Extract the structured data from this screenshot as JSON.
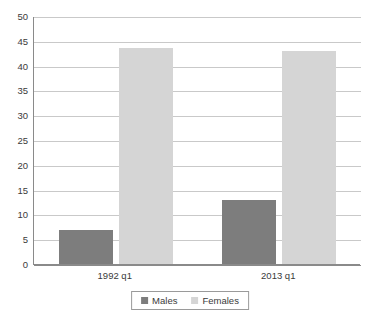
{
  "chart_data": {
    "type": "bar",
    "title": "",
    "subtitle": "",
    "xlabel": "",
    "ylabel": "",
    "categories": [
      "1992 q1",
      "2013 q1"
    ],
    "series": [
      {
        "name": "Males",
        "values": [
          6.8,
          13.0
        ],
        "color": "#7d7d7d"
      },
      {
        "name": "Females",
        "values": [
          43.5,
          43.0
        ],
        "color": "#d5d5d5"
      }
    ],
    "ylim": [
      0,
      50
    ],
    "ytick_step": 5,
    "ytick_labels": [
      "0",
      "5",
      "10",
      "15",
      "20",
      "25",
      "30",
      "35",
      "40",
      "45",
      "50"
    ],
    "ytick_values": [
      0,
      5,
      10,
      15,
      20,
      25,
      30,
      35,
      40,
      45,
      50
    ],
    "grid": "horizontal",
    "legend_position": "bottom-center",
    "axis_color": "#8a8a8a",
    "grid_color": "#c9c9c9",
    "background": "#ffffff"
  },
  "legend": {
    "items": [
      {
        "label": "Males"
      },
      {
        "label": "Females"
      }
    ]
  }
}
